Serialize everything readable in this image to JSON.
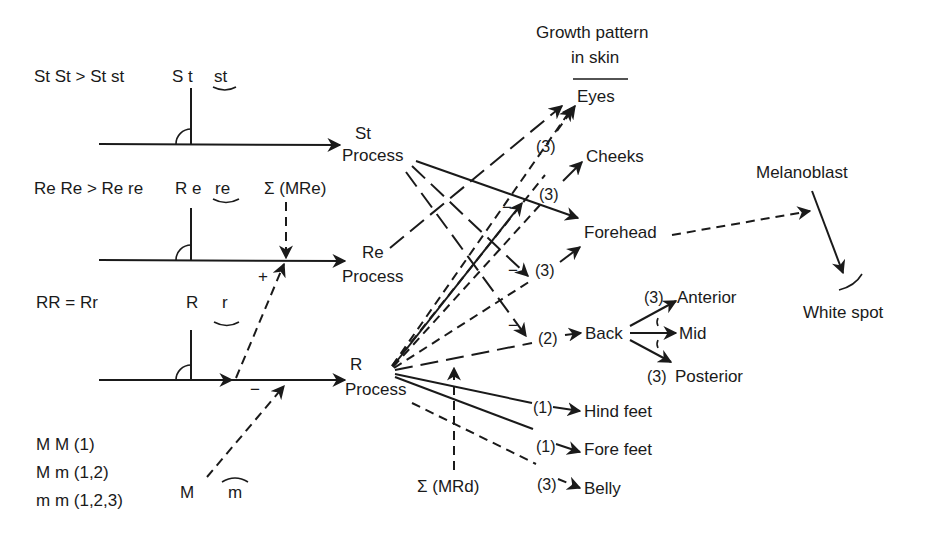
{
  "genotypes": {
    "st": "St St > St st",
    "re": "Re Re > Re re",
    "r": "RR = Rr",
    "m": [
      "M M (1)",
      "M m (1,2)",
      "m m (1,2,3)"
    ]
  },
  "alleles": {
    "st_dom": "S t",
    "st_rec": "st",
    "re_dom": "R e",
    "re_rec": "re",
    "r_dom": "R",
    "r_rec": "r",
    "m_dom": "M",
    "m_rec": "m"
  },
  "modifiers": {
    "mre": "Σ (MRe)",
    "mrd": "Σ (MRd)",
    "plus": "+",
    "minus": "−"
  },
  "processes": {
    "st": [
      "St",
      "Process"
    ],
    "re": [
      "Re",
      "Process"
    ],
    "r": [
      "R",
      "Process"
    ]
  },
  "header": {
    "line1": "Growth pattern",
    "line2": "in skin"
  },
  "targets": {
    "eyes": "Eyes",
    "cheeks": "Cheeks",
    "forehead": "Forehead",
    "back": "Back",
    "anterior": "Anterior",
    "mid": "Mid",
    "posterior": "Posterior",
    "hind_feet": "Hind feet",
    "fore_feet": "Fore feet",
    "belly": "Belly",
    "melanoblast": "Melanoblast",
    "white_spot": "White spot"
  },
  "levels": {
    "eyes": "(3)",
    "cheeks": "(3)",
    "forehead": "(3)",
    "back": "(2)",
    "anterior": "(3)",
    "posterior": "(3)",
    "hind_feet": "(1)",
    "fore_feet": "(1)",
    "belly": "(3)"
  },
  "signs": {
    "minus": "−"
  }
}
